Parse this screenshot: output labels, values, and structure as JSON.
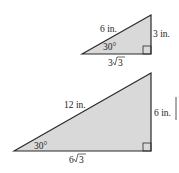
{
  "figures": [
    {
      "name": "small-triangle",
      "hypotenuse": "6 in.",
      "opposite_side": "3 in.",
      "adjacent_coef": "3",
      "adjacent_radicand": "3",
      "angle": "30°",
      "right_angle": true
    },
    {
      "name": "large-triangle",
      "hypotenuse": "12 in.",
      "opposite_side": "6 in.",
      "adjacent_coef": "6",
      "adjacent_radicand": "3",
      "angle": "30°",
      "right_angle": true
    }
  ],
  "colors": {
    "fill": "#d9d9d9",
    "stroke": "#2a2a2a"
  }
}
